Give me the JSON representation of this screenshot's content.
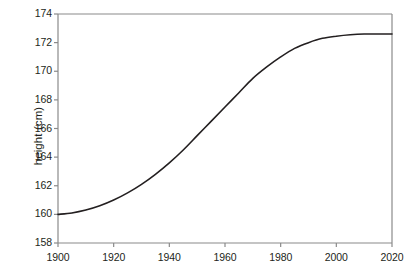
{
  "chart_data": {
    "type": "line",
    "title": "",
    "xlabel": "",
    "ylabel": "height (cm)",
    "xlim": [
      1900,
      2020
    ],
    "ylim": [
      158,
      174
    ],
    "xticks": [
      1900,
      1920,
      1940,
      1960,
      1980,
      2000,
      2020
    ],
    "xtick_labels": [
      "1900",
      "1920",
      "1940",
      "1960",
      "1980",
      "2000",
      "2020"
    ],
    "yticks": [
      158,
      160,
      162,
      164,
      166,
      168,
      170,
      172,
      174
    ],
    "ytick_labels": [
      "158",
      "160",
      "162",
      "164",
      "166",
      "168",
      "170",
      "172",
      "174"
    ],
    "grid": false,
    "legend": false,
    "line_color": "#231f20",
    "axis_color": "#8a8a8a",
    "background": "#ffffff",
    "series": [
      {
        "name": "mean height",
        "x": [
          1900,
          1905,
          1910,
          1915,
          1920,
          1925,
          1930,
          1935,
          1940,
          1945,
          1950,
          1955,
          1960,
          1965,
          1970,
          1975,
          1980,
          1985,
          1990,
          1995,
          2000,
          2005,
          2010,
          2015,
          2020
        ],
        "values": [
          160.0,
          160.1,
          160.3,
          160.6,
          161.0,
          161.5,
          162.1,
          162.8,
          163.6,
          164.5,
          165.5,
          166.5,
          167.5,
          168.5,
          169.5,
          170.3,
          171.0,
          171.6,
          172.0,
          172.3,
          172.45,
          172.55,
          172.6,
          172.6,
          172.6
        ]
      }
    ],
    "annotations": []
  },
  "axis": {
    "y_title": "height (cm)"
  }
}
